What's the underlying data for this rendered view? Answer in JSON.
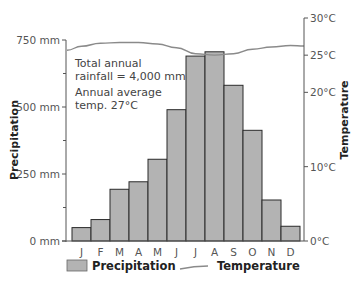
{
  "chart_data": {
    "type": "bar+line",
    "title": "",
    "categories": [
      "J",
      "F",
      "M",
      "A",
      "M",
      "J",
      "J",
      "A",
      "S",
      "O",
      "N",
      "D"
    ],
    "series": [
      {
        "name": "Precipitation",
        "type": "bar",
        "axis": "left",
        "unit": "mm",
        "values": [
          50,
          80,
          193,
          221,
          305,
          490,
          690,
          706,
          581,
          413,
          153,
          55
        ]
      },
      {
        "name": "Temperature",
        "type": "line",
        "axis": "right",
        "unit": "°C",
        "values": [
          26.2,
          26.6,
          26.7,
          26.7,
          26.5,
          26.0,
          25.2,
          25.0,
          25.2,
          25.8,
          26.1,
          26.3
        ]
      }
    ],
    "left_axis": {
      "label": "Precipitation",
      "ylim": [
        0,
        750
      ],
      "ticks": [
        {
          "value": 0,
          "label": "0 mm"
        },
        {
          "value": 250,
          "label": "250 mm"
        },
        {
          "value": 500,
          "label": "500 mm"
        },
        {
          "value": 750,
          "label": "750 mm"
        }
      ],
      "minor_ticks": [
        125,
        375,
        625
      ]
    },
    "right_axis": {
      "label": "Temperature",
      "ylim": [
        0,
        30
      ],
      "ticks": [
        {
          "value": 0,
          "label": "0°C"
        },
        {
          "value": 10,
          "label": "10°C"
        },
        {
          "value": 20,
          "label": "20°C"
        },
        {
          "value": 25,
          "label": "25°C"
        },
        {
          "value": 30,
          "label": "30°C"
        }
      ]
    },
    "annotations": [
      "Total annual",
      "rainfall = 4,000 mm",
      "Annual average",
      "temp. 27°C"
    ],
    "legend": [
      {
        "label": "Precipitation",
        "kind": "bar-swatch"
      },
      {
        "label": "Temperature",
        "kind": "line-swatch"
      }
    ],
    "grid": false,
    "legend_position": "bottom",
    "colors": {
      "bar_fill": "#b3b3b3",
      "bar_stroke": "#2b2b2b",
      "line": "#8a8a8a",
      "axis": "#555555"
    }
  }
}
